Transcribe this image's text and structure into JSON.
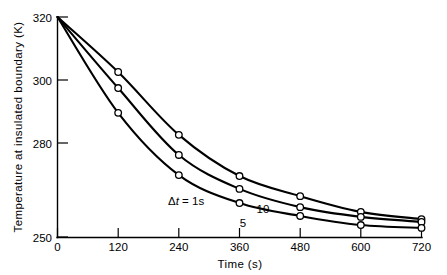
{
  "chart_data": {
    "type": "line",
    "title": "",
    "xlabel": "Time (s)",
    "ylabel": "Temperature at insulated boundary (K)",
    "xlim": [
      0,
      720
    ],
    "ylim": [
      250,
      320
    ],
    "xticks": [
      0,
      120,
      240,
      360,
      480,
      600,
      720
    ],
    "xtick_labels": [
      "0",
      "120",
      "240",
      "360",
      "480",
      "600",
      "720"
    ],
    "yticks": [
      250,
      280,
      300,
      320
    ],
    "ytick_labels": [
      "250",
      "280",
      "300",
      "320"
    ],
    "grid": false,
    "legend": "inline-curve-labels",
    "marker": "open-circle",
    "x": [
      0,
      120,
      240,
      360,
      480,
      600,
      720
    ],
    "series": [
      {
        "name": "10",
        "label": "10",
        "label_x": 372,
        "label_y": 271.5,
        "values": [
          320,
          302.5,
          282.5,
          269.4,
          263.0,
          258.0,
          255.7
        ]
      },
      {
        "name": "5",
        "label": "5",
        "label_x": 340,
        "label_y": 267.0,
        "values": [
          320,
          297.4,
          276.1,
          265.3,
          259.5,
          256.4,
          254.8
        ]
      },
      {
        "name": "1",
        "label": "Δt = 1s",
        "label_x": 222,
        "label_y": 260.5,
        "values": [
          320,
          289.5,
          269.7,
          260.8,
          256.7,
          253.8,
          252.9
        ]
      }
    ],
    "annotations": [
      {
        "text": "10",
        "series": "10"
      },
      {
        "text": "5",
        "series": "5"
      },
      {
        "text": "Δt = 1s",
        "series": "1"
      }
    ]
  },
  "labels": {
    "delta_symbol": "Δ",
    "delta_var": "t",
    "delta_rest": " =  1s",
    "series_10": "10",
    "series_5": "5",
    "x_title": "Time  (s)",
    "y_title": "Temperature  at  insulated  boundary  (K)"
  },
  "ticks": {
    "y": [
      "320",
      "300",
      "280",
      "250"
    ],
    "x": [
      "0",
      "120",
      "240",
      "360",
      "480",
      "600",
      "720"
    ]
  },
  "colors": {
    "background": "#ffffff",
    "ink": "#000000",
    "marker_fill": "#ffffff"
  }
}
